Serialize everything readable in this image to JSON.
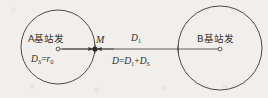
{
  "figure": {
    "background_color": "#f1efeb",
    "stroke_color": "#3a3734",
    "labels": {
      "station_a": "A基站发",
      "station_b": "B基站发",
      "midpoint": "M",
      "distance_d1_main": "D",
      "distance_d1_sub": "1",
      "radius_label_lhs": "D",
      "radius_label_lhs_sub": "S",
      "radius_label_eq": "=",
      "radius_label_rhs": "r",
      "radius_label_rhs_sub": "0",
      "sum_lhs": "D",
      "sum_eq1": "=",
      "sum_term1": "D",
      "sum_term1_sub": "1",
      "sum_plus": "+",
      "sum_term2": "D",
      "sum_term2_sub": "S"
    },
    "geometry": {
      "circle_a": {
        "cx": 58,
        "cy": 47,
        "r": 37
      },
      "circle_b": {
        "cx": 220,
        "cy": 48,
        "r": 42
      },
      "baseline": {
        "x1": 58,
        "y1": 49,
        "x2": 220,
        "y2": 49
      },
      "point_m": {
        "cx": 95,
        "cy": 49,
        "r": 2.6
      },
      "marker_a": {
        "cx": 58,
        "cy": 49,
        "r": 1.9
      },
      "marker_b": {
        "cx": 220,
        "cy": 49,
        "r": 1.9
      }
    }
  }
}
